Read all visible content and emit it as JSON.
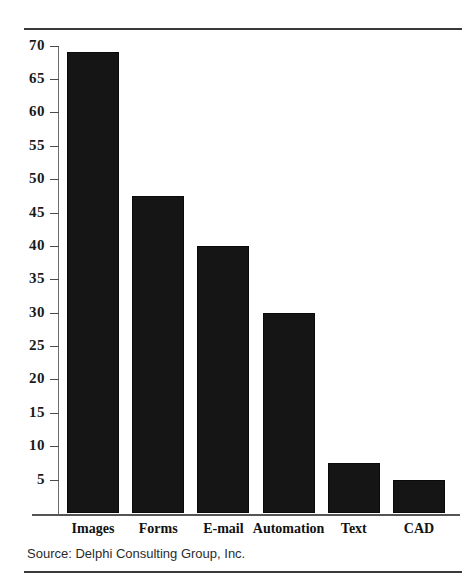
{
  "chart_data": {
    "type": "bar",
    "title": "",
    "subtitle": "",
    "xlabel": "",
    "ylabel": "",
    "categories": [
      "Images",
      "Forms",
      "E-mail",
      "Automation",
      "Text",
      "CAD"
    ],
    "values": [
      69,
      47.5,
      40,
      30,
      7.5,
      5
    ],
    "series": [
      {
        "name": "",
        "values": [
          69,
          47.5,
          40,
          30,
          7.5,
          5
        ]
      }
    ],
    "ylim": [
      0,
      72
    ],
    "yticks": [
      70,
      65,
      60,
      55,
      50,
      45,
      40,
      35,
      30,
      25,
      20,
      15,
      10,
      5
    ],
    "ytick_labels": [
      "70",
      "65",
      "60",
      "55",
      "50",
      "45",
      "40",
      "35",
      "30",
      "25",
      "20",
      "15",
      "10",
      "5"
    ],
    "grid": false,
    "legend": false,
    "legend_position": "none",
    "bar_color": "#151515",
    "annotations": []
  },
  "source": {
    "text": "Source:  Delphi Consulting Group, Inc."
  },
  "axis": {
    "tick_color": "#4a4a4a",
    "axis_color": "#555555"
  },
  "rules": {
    "top_color": "#3a3a3a",
    "bottom_color": "#3a3a3a"
  }
}
